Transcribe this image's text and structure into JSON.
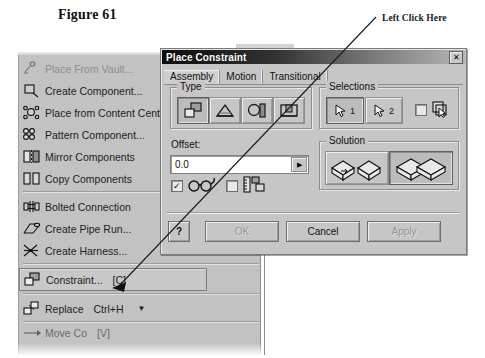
{
  "figure": {
    "caption": "Figure 61",
    "annotation": "Left Click Here"
  },
  "menu": {
    "name": "assemble-panel-menu",
    "items": [
      {
        "label": "Place From Vault...",
        "icon": "place-from-vault-icon",
        "disabled": true,
        "shortcut": "",
        "submenu": false,
        "boxed": false
      },
      {
        "label": "Create Component...",
        "icon": "create-component-icon",
        "disabled": false,
        "shortcut": "",
        "submenu": false,
        "boxed": false
      },
      {
        "label": "Place from Content Cent",
        "icon": "content-center-icon",
        "disabled": false,
        "shortcut": "",
        "submenu": false,
        "boxed": false
      },
      {
        "label": "Pattern Component...",
        "icon": "pattern-component-icon",
        "disabled": false,
        "shortcut": "",
        "submenu": false,
        "boxed": false
      },
      {
        "label": "Mirror Components",
        "icon": "mirror-components-icon",
        "disabled": false,
        "shortcut": "",
        "submenu": false,
        "boxed": false
      },
      {
        "label": "Copy Components",
        "icon": "copy-components-icon",
        "disabled": false,
        "shortcut": "",
        "submenu": false,
        "boxed": false
      },
      {
        "label": "Bolted Connection",
        "icon": "bolted-connection-icon",
        "disabled": false,
        "shortcut": "",
        "submenu": false,
        "boxed": false
      },
      {
        "label": "Create Pipe Run...",
        "icon": "create-pipe-run-icon",
        "disabled": false,
        "shortcut": "",
        "submenu": false,
        "boxed": false
      },
      {
        "label": "Create Harness...",
        "icon": "create-harness-icon",
        "disabled": false,
        "shortcut": "",
        "submenu": false,
        "boxed": false
      },
      {
        "label": "Constraint...",
        "icon": "constraint-icon",
        "disabled": false,
        "shortcut": "[C]",
        "submenu": false,
        "boxed": true
      },
      {
        "label": "Replace",
        "icon": "replace-icon",
        "disabled": false,
        "shortcut": "Ctrl+H",
        "submenu": true,
        "boxed": false
      },
      {
        "label": "Move Co",
        "icon": "move-component-icon",
        "disabled": false,
        "shortcut": "[V]",
        "submenu": false,
        "boxed": false
      }
    ]
  },
  "dialog": {
    "title": "Place Constraint",
    "close_label": "✕",
    "tabs": [
      {
        "label": "Assembly",
        "active": true
      },
      {
        "label": "Motion",
        "active": false
      },
      {
        "label": "Transitional",
        "active": false
      }
    ],
    "type_group": {
      "label": "Type",
      "buttons": [
        {
          "name": "mate-constraint-button",
          "selected": true
        },
        {
          "name": "angle-constraint-button",
          "selected": false
        },
        {
          "name": "tangent-constraint-button",
          "selected": false
        },
        {
          "name": "insert-constraint-button",
          "selected": false
        }
      ]
    },
    "selections_group": {
      "label": "Selections",
      "buttons": [
        {
          "name": "select-first-button",
          "number": "1",
          "selected": true
        },
        {
          "name": "select-second-button",
          "number": "2",
          "selected": false
        }
      ],
      "pick_part_first": {
        "label": "",
        "checked": false
      }
    },
    "offset": {
      "label": "Offset:",
      "value": "0.0",
      "spin_glyph": "▶"
    },
    "options": [
      {
        "name": "predict-offset-checkbox",
        "checked": true,
        "icon": "glasses-icon"
      },
      {
        "name": "show-dimension-checkbox",
        "checked": false,
        "icon": "measure-icon"
      }
    ],
    "solution_group": {
      "label": "Solution",
      "buttons": [
        {
          "name": "solution-opposed-button",
          "selected": false
        },
        {
          "name": "solution-aligned-button",
          "selected": true
        }
      ]
    },
    "buttons": {
      "help": {
        "label": "?",
        "disabled": false
      },
      "ok": {
        "label": "OK",
        "disabled": true
      },
      "cancel": {
        "label": "Cancel",
        "disabled": false
      },
      "apply": {
        "label": "Apply",
        "disabled": true
      }
    }
  },
  "colors": {
    "dialog_face": "#c6c6c6",
    "menu_face": "#c2c2c2",
    "titlebar_dark": "#0d0d0d",
    "field_bg": "#ffffff"
  }
}
